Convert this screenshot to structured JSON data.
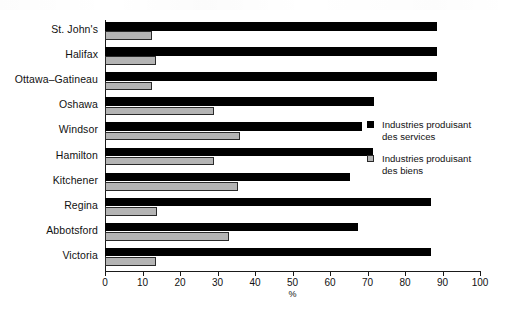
{
  "chart_data": {
    "type": "bar",
    "orientation": "horizontal",
    "title": "",
    "subtitle": "",
    "xlabel": "%",
    "ylabel": "",
    "xlim": [
      0,
      100
    ],
    "xticks": [
      0,
      10,
      20,
      30,
      40,
      50,
      60,
      70,
      80,
      90,
      100
    ],
    "grid": false,
    "legend_position": "right",
    "categories": [
      "St. John's",
      "Halifax",
      "Ottawa–Gatineau",
      "Oshawa",
      "Windsor",
      "Hamilton",
      "Kitchener",
      "Regina",
      "Abbotsford",
      "Victoria"
    ],
    "series": [
      {
        "name": "Industries produisant des services",
        "color": "#000000",
        "values": [
          88.5,
          88.5,
          88.5,
          71.7,
          68.5,
          71.5,
          65.3,
          87.0,
          67.5,
          87.0
        ]
      },
      {
        "name": "Industries produisant des biens",
        "color": "#b4b4b4",
        "values": [
          12.5,
          13.6,
          12.5,
          29.0,
          36.0,
          29.0,
          35.5,
          13.9,
          33.0,
          13.5
        ]
      }
    ]
  },
  "legend": {
    "items": [
      {
        "line1": "Industries produisant",
        "line2": "des services",
        "swatch": "black-square"
      },
      {
        "line1": "Industries produisant",
        "line2": "des biens",
        "swatch": "gray-square"
      }
    ]
  },
  "axis": {
    "x_title": "%",
    "tick_labels": [
      "0",
      "10",
      "20",
      "30",
      "40",
      "50",
      "60",
      "70",
      "80",
      "90",
      "100"
    ]
  },
  "colors": {
    "services": "#000000",
    "biens": "#b4b4b4",
    "axis": "#1a1a1a",
    "background": "#ffffff"
  }
}
